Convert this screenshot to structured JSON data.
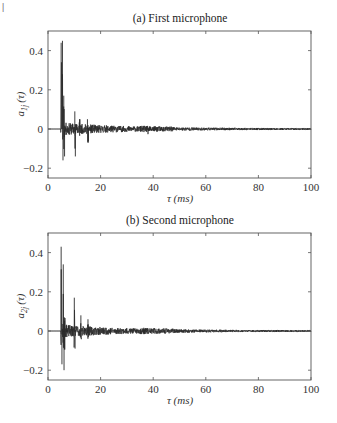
{
  "page_marker": "|",
  "chart_data": [
    {
      "type": "line",
      "title": "(a) First microphone",
      "xlabel": "τ (ms)",
      "ylabel": "a_{1j} (τ)",
      "ylabel_main": "a",
      "ylabel_sub": "1j",
      "ylabel_arg": "(τ)",
      "xlim": [
        0,
        100
      ],
      "ylim": [
        -0.25,
        0.5
      ],
      "xticks": [
        0,
        20,
        40,
        60,
        80,
        100
      ],
      "xtick_labels": [
        "0",
        "20",
        "40",
        "60",
        "80",
        "100"
      ],
      "yticks": [
        -0.2,
        0,
        0.2,
        0.4
      ],
      "ytick_labels": [
        "−0.2",
        "0",
        "0.2",
        "0.4"
      ],
      "grid": false,
      "description": "Room impulse response: near zero until ~5 ms, main peak ~0.45 at ~5.5 ms with dips to ~-0.15, secondary reflections at ~10 ms (0.09/-0.14), ~12 ms, ~15 ms (0.05/-0.07), then decaying oscillatory tail around 0 to 100 ms.",
      "key_points": [
        {
          "x": 5.0,
          "y": 0.44
        },
        {
          "x": 5.5,
          "y": 0.45
        },
        {
          "x": 5.7,
          "y": -0.16
        },
        {
          "x": 6.0,
          "y": 0.17
        },
        {
          "x": 6.3,
          "y": -0.14
        },
        {
          "x": 7.5,
          "y": 0.03
        },
        {
          "x": 10.2,
          "y": 0.09
        },
        {
          "x": 10.4,
          "y": -0.14
        },
        {
          "x": 12.0,
          "y": 0.05
        },
        {
          "x": 15.0,
          "y": 0.05
        },
        {
          "x": 15.3,
          "y": -0.07
        },
        {
          "x": 20,
          "y": 0.02
        },
        {
          "x": 38,
          "y": 0.02
        },
        {
          "x": 44,
          "y": 0.015
        },
        {
          "x": 60,
          "y": 0.008
        },
        {
          "x": 80,
          "y": 0.005
        },
        {
          "x": 100,
          "y": 0.003
        }
      ],
      "seed": 11,
      "peaks": [
        {
          "t": 5.1,
          "amp": 0.44,
          "neg": -0.12,
          "w": 0.15
        },
        {
          "t": 5.5,
          "amp": 0.45,
          "neg": -0.16,
          "w": 0.15
        },
        {
          "t": 6.0,
          "amp": 0.17,
          "neg": -0.14,
          "w": 0.3
        },
        {
          "t": 10.3,
          "amp": 0.09,
          "neg": -0.14,
          "w": 0.2
        },
        {
          "t": 12.0,
          "amp": 0.05,
          "neg": -0.05,
          "w": 0.4
        },
        {
          "t": 15.2,
          "amp": 0.05,
          "neg": -0.07,
          "w": 0.3
        },
        {
          "t": 38.0,
          "amp": 0.02,
          "neg": -0.02,
          "w": 0.3
        }
      ]
    },
    {
      "type": "line",
      "title": "(b) Second microphone",
      "xlabel": "τ (ms)",
      "ylabel": "a_{2j} (τ)",
      "ylabel_main": "a",
      "ylabel_sub": "2j",
      "ylabel_arg": "(τ)",
      "xlim": [
        0,
        100
      ],
      "ylim": [
        -0.25,
        0.5
      ],
      "xticks": [
        0,
        20,
        40,
        60,
        80,
        100
      ],
      "xtick_labels": [
        "0",
        "20",
        "40",
        "60",
        "80",
        "100"
      ],
      "yticks": [
        -0.2,
        0,
        0.2,
        0.4
      ],
      "ytick_labels": [
        "−0.2",
        "0",
        "0.2",
        "0.4"
      ],
      "grid": false,
      "description": "Room impulse response: main peak ~0.43 at ~5 ms, second peak ~0.34 at ~5.8 ms, min ~-0.20 at ~6 ms, reflections at ~10 ms (0.17/-0.09), ~12.5 ms (0.08), ~15 ms (0.06), then decaying tail to 100 ms.",
      "key_points": [
        {
          "x": 5.0,
          "y": 0.43
        },
        {
          "x": 5.3,
          "y": -0.17
        },
        {
          "x": 5.8,
          "y": 0.34
        },
        {
          "x": 6.1,
          "y": -0.2
        },
        {
          "x": 7.5,
          "y": 0.02
        },
        {
          "x": 10.0,
          "y": 0.17
        },
        {
          "x": 10.3,
          "y": -0.09
        },
        {
          "x": 12.5,
          "y": 0.08
        },
        {
          "x": 15.2,
          "y": 0.06
        },
        {
          "x": 15.5,
          "y": -0.04
        },
        {
          "x": 20,
          "y": 0.015
        },
        {
          "x": 38,
          "y": 0.015
        },
        {
          "x": 45,
          "y": 0.012
        },
        {
          "x": 60,
          "y": 0.006
        },
        {
          "x": 80,
          "y": 0.004
        },
        {
          "x": 100,
          "y": 0.003
        }
      ],
      "seed": 23,
      "peaks": [
        {
          "t": 5.0,
          "amp": 0.43,
          "neg": -0.17,
          "w": 0.15
        },
        {
          "t": 5.8,
          "amp": 0.34,
          "neg": -0.2,
          "w": 0.15
        },
        {
          "t": 6.3,
          "amp": 0.1,
          "neg": -0.12,
          "w": 0.3
        },
        {
          "t": 10.0,
          "amp": 0.17,
          "neg": -0.09,
          "w": 0.2
        },
        {
          "t": 12.5,
          "amp": 0.08,
          "neg": -0.05,
          "w": 0.3
        },
        {
          "t": 15.2,
          "amp": 0.06,
          "neg": -0.04,
          "w": 0.3
        },
        {
          "t": 38.0,
          "amp": 0.015,
          "neg": -0.015,
          "w": 0.3
        }
      ]
    }
  ]
}
